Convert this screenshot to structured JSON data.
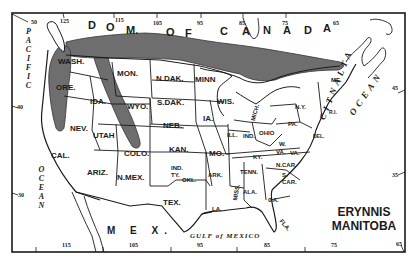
{
  "map": {
    "title": {
      "line1": "ERYNNIS",
      "line2": "MANITOBA"
    },
    "colors": {
      "background": "#ffffff",
      "ink": "#1a1a1a",
      "range_fill": "#6e6e6e"
    },
    "regions": {
      "canada": [
        "D",
        "O",
        "M.",
        "O",
        "F",
        "C",
        "A",
        "N",
        "A",
        "D",
        "A"
      ],
      "mexico": "M E X.",
      "gulf": "GULF of MEXICO",
      "pacific": [
        "P",
        "A",
        "C",
        "I",
        "F",
        "I",
        "C"
      ],
      "pacific_ocean": [
        "O",
        "C",
        "E",
        "A",
        "N"
      ],
      "atlantic": [
        "A",
        "T",
        "L",
        "A",
        "N",
        "T",
        "I",
        "C"
      ],
      "atlantic_ocean": [
        "O",
        "C",
        "E",
        "A",
        "N"
      ]
    },
    "states": {
      "wash": "WASH.",
      "ore": "ORE.",
      "cal": "CAL.",
      "nev": "NEV.",
      "idaho": "IDA.",
      "utah": "UTAH",
      "ariz": "ARIZ.",
      "mon": "MON.",
      "wyo": "WYO.",
      "colo": "COLO.",
      "nmex": "N.MEX.",
      "ndak": "N.DAK.",
      "sdak": "S.DAK.",
      "neb": "NEB.",
      "kan": "KAN.",
      "indty": "IND.",
      "indty2": "TY.",
      "okl": "OKL.",
      "tex": "TEX.",
      "minn": "MINN",
      "ia": "IA.",
      "mo": "MO.",
      "ark": "ARK.",
      "la": "LA.",
      "wis": "WIS.",
      "ill": "ILL.",
      "mich": "MICH.",
      "ind": "IND.",
      "ohio": "OHIO",
      "ky": "KY.",
      "tenn": "TENN.",
      "miss": "MISS.",
      "ala": "ALA.",
      "ga": "GA.",
      "fla": "FLA.",
      "ncar": "N.CAR.",
      "scar1": "S.",
      "scar2": "CAR.",
      "va": "VA.",
      "wva1": "W.",
      "wva2": "VA.",
      "pa": "PA.",
      "ny": "N.Y.",
      "me": "ME.",
      "del": "DEL.",
      "ri": "R.I."
    },
    "top_ticks": [
      "125",
      "115",
      "105",
      "95",
      "85",
      "75",
      "65"
    ],
    "bottom_ticks": [
      "115",
      "105",
      "95",
      "85",
      "75",
      "65"
    ],
    "left_ticks": [
      "50",
      "40",
      "30"
    ],
    "right_ticks": [
      "45",
      "35"
    ]
  }
}
